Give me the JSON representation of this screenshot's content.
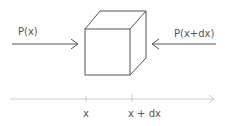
{
  "diagram": {
    "left_force_label": "P(x)",
    "right_force_label": "P(x+dx)",
    "axis": {
      "tick_labels": [
        "x",
        "x + dx"
      ]
    },
    "colors": {
      "stroke": "#555555",
      "axis": "#cccccc",
      "text": "#555555"
    }
  }
}
